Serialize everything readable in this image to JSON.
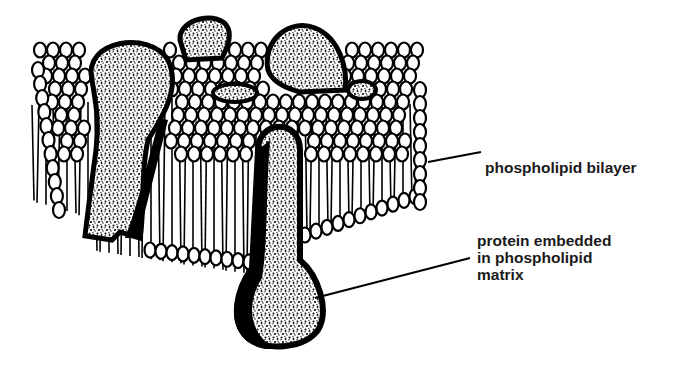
{
  "diagram": {
    "colors": {
      "ink": "#000000",
      "background": "#ffffff",
      "label_text": "#1a1a1a"
    },
    "labels": {
      "bilayer": "phospholipid bilayer",
      "protein_line1": "protein embedded",
      "protein_line2": "in phospholipid",
      "protein_line3": "matrix"
    },
    "elements": [
      {
        "name": "phospholipid-bilayer",
        "type": "membrane-slab"
      },
      {
        "name": "integral-protein-left",
        "type": "protein"
      },
      {
        "name": "peripheral-protein-top-center",
        "type": "protein"
      },
      {
        "name": "peripheral-protein-top-right",
        "type": "protein"
      },
      {
        "name": "protein-front-embedded",
        "type": "protein"
      }
    ]
  }
}
